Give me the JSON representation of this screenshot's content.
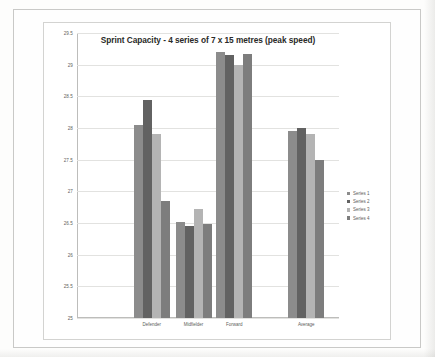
{
  "chart_data": {
    "type": "bar",
    "title": "Sprint Capacity - 4 series of 7 x 15 metres (peak speed)",
    "xlabel": "",
    "ylabel": "",
    "ylim": [
      25,
      29.5
    ],
    "ytick_step": 0.5,
    "yticks": [
      "29.5",
      "29",
      "28.5",
      "28",
      "27.5",
      "27",
      "26.5",
      "26",
      "25.5",
      "25"
    ],
    "grid": true,
    "legend_position": "right",
    "categories": [
      "Defender",
      "Midfielder",
      "Forward",
      "Average"
    ],
    "series": [
      {
        "name": "Series 1",
        "color": "#8c8c8c",
        "values": [
          28.05,
          26.52,
          29.2,
          27.95
        ]
      },
      {
        "name": "Series 2",
        "color": "#626262",
        "values": [
          28.45,
          26.45,
          29.15,
          28.0
        ]
      },
      {
        "name": "Series 3",
        "color": "#b4b4b4",
        "values": [
          27.9,
          26.72,
          29.0,
          27.9
        ]
      },
      {
        "name": "Series 4",
        "color": "#7d7d7d",
        "values": [
          26.85,
          26.48,
          29.17,
          27.5
        ]
      }
    ]
  }
}
